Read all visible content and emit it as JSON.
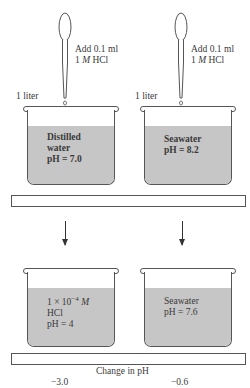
{
  "experiment": {
    "pipette_label_line1": "Add 0.1 ml",
    "pipette_label_line2_num": "1 ",
    "pipette_label_line2_unit": "M",
    "pipette_label_line2_rest": " HCl",
    "volume_label": "1 liter"
  },
  "before": {
    "left": {
      "line1": "Distilled",
      "line2": "water",
      "line3": "pH = 7.0"
    },
    "right": {
      "line1": "Seawater",
      "line2": "pH = 8.2"
    }
  },
  "after": {
    "left": {
      "line1_prefix": "1 × 10",
      "line1_exp": "−4",
      "line1_unit": " M",
      "line2": "HCl",
      "line3": "pH = 4"
    },
    "right": {
      "line1": "Seawater",
      "line2": "pH = 7.6"
    }
  },
  "result": {
    "title": "Change in pH",
    "left_value": "−3.0",
    "right_value": "−0.6"
  },
  "colors": {
    "liquid": "#c6c6c6",
    "outline": "#555555"
  }
}
